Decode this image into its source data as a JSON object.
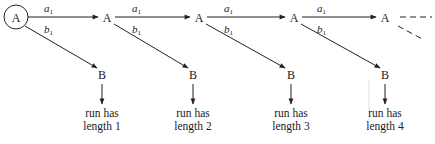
{
  "diagram": {
    "type": "state-transition",
    "start_node": "A",
    "nodes_top": [
      "A",
      "A",
      "A",
      "A",
      "A"
    ],
    "nodes_bottom": [
      "B",
      "B",
      "B",
      "B"
    ],
    "edge_labels": {
      "horizontal": {
        "base": "a",
        "sub": "1"
      },
      "diagonal": {
        "base": "b",
        "sub": "1"
      }
    },
    "outcomes": [
      {
        "line1": "run has",
        "line2": "length 1"
      },
      {
        "line1": "run has",
        "line2": "length 2"
      },
      {
        "line1": "run has",
        "line2": "length 3"
      },
      {
        "line1": "run has",
        "line2": "length 4"
      }
    ],
    "continuation": "dashed"
  }
}
